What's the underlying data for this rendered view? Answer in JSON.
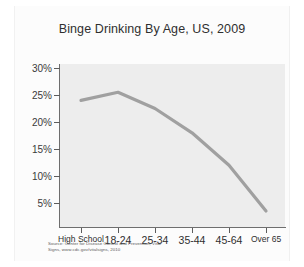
{
  "page": {
    "background_color": "#ffffff",
    "sheet_color": "#fcfcfc"
  },
  "chart_data": {
    "type": "line",
    "title": "Binge Drinking By Age, US, 2009",
    "xlabel": "",
    "ylabel": "",
    "categories": [
      "High School",
      "18-24",
      "25-34",
      "35-44",
      "45-64",
      "Over 65"
    ],
    "values": [
      24,
      25.5,
      22.5,
      18,
      12,
      3.5
    ],
    "series": [
      {
        "name": "Binge drinking prevalence",
        "values": [
          24,
          25.5,
          22.5,
          18,
          12,
          3.5
        ]
      }
    ],
    "ylim": [
      0,
      30
    ],
    "ytick_values": [
      30,
      25,
      20,
      15,
      10,
      5
    ],
    "ytick_labels": [
      "30%",
      "25%",
      "20%",
      "15%",
      "10%",
      "5%"
    ],
    "grid": false,
    "legend": false,
    "legend_position": "none",
    "line_color": "#a0a0a0",
    "plot_background": "#ededed",
    "axis_color": "#6e6e6e"
  },
  "source": {
    "line1": "Source: Center for Disease Control and Prevention, Vital",
    "line2": "Signs, www.cdc.gov/vitalsigns, 2010"
  }
}
